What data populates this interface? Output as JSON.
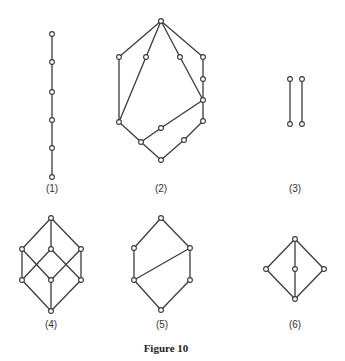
{
  "caption": "Figure 10",
  "colors": {
    "stroke": "#3a3a3a",
    "node_fill": "#ffffff",
    "text": "#333333"
  },
  "diagrams": [
    {
      "label": "(1)",
      "label_pos": [
        52,
        192
      ],
      "nodes": [
        [
          52,
          34
        ],
        [
          52,
          62
        ],
        [
          52,
          92
        ],
        [
          52,
          120
        ],
        [
          52,
          148
        ],
        [
          52,
          177
        ]
      ],
      "edges": [
        [
          0,
          1
        ],
        [
          1,
          2
        ],
        [
          2,
          3
        ],
        [
          3,
          4
        ],
        [
          4,
          5
        ]
      ]
    },
    {
      "label": "(2)",
      "label_pos": [
        161,
        192
      ],
      "nodes": [
        [
          161,
          21
        ],
        [
          119,
          57
        ],
        [
          146,
          57
        ],
        [
          180,
          57
        ],
        [
          203,
          57
        ],
        [
          203,
          79
        ],
        [
          203,
          100
        ],
        [
          203,
          121
        ],
        [
          119,
          122
        ],
        [
          161,
          128
        ],
        [
          141,
          142
        ],
        [
          184,
          140
        ],
        [
          161,
          160
        ]
      ],
      "edges": [
        [
          0,
          1
        ],
        [
          0,
          2
        ],
        [
          0,
          3
        ],
        [
          0,
          4
        ],
        [
          1,
          8
        ],
        [
          2,
          8
        ],
        [
          3,
          6
        ],
        [
          4,
          5
        ],
        [
          5,
          6
        ],
        [
          6,
          7
        ],
        [
          6,
          9
        ],
        [
          9,
          10
        ],
        [
          8,
          10
        ],
        [
          10,
          12
        ],
        [
          7,
          11
        ],
        [
          11,
          12
        ]
      ]
    },
    {
      "label": "(3)",
      "label_pos": [
        295,
        192
      ],
      "nodes": [
        [
          290,
          79
        ],
        [
          290,
          124
        ],
        [
          302,
          79
        ],
        [
          302,
          124
        ]
      ],
      "edges": [
        [
          0,
          1
        ],
        [
          2,
          3
        ]
      ]
    },
    {
      "label": "(4)",
      "label_pos": [
        51,
        328
      ],
      "nodes": [
        [
          51,
          218
        ],
        [
          22,
          249
        ],
        [
          51,
          249
        ],
        [
          81,
          249
        ],
        [
          22,
          280
        ],
        [
          51,
          280
        ],
        [
          81,
          280
        ],
        [
          51,
          311
        ]
      ],
      "edges": [
        [
          0,
          1
        ],
        [
          0,
          2
        ],
        [
          0,
          3
        ],
        [
          1,
          4
        ],
        [
          1,
          5
        ],
        [
          2,
          4
        ],
        [
          2,
          6
        ],
        [
          3,
          5
        ],
        [
          3,
          6
        ],
        [
          4,
          7
        ],
        [
          5,
          7
        ],
        [
          6,
          7
        ]
      ]
    },
    {
      "label": "(5)",
      "label_pos": [
        162,
        328
      ],
      "nodes": [
        [
          161,
          218
        ],
        [
          134,
          248
        ],
        [
          190,
          248
        ],
        [
          134,
          280
        ],
        [
          190,
          280
        ],
        [
          161,
          310
        ]
      ],
      "edges": [
        [
          0,
          1
        ],
        [
          0,
          2
        ],
        [
          1,
          3
        ],
        [
          2,
          3
        ],
        [
          2,
          4
        ],
        [
          3,
          5
        ],
        [
          4,
          5
        ]
      ]
    },
    {
      "label": "(6)",
      "label_pos": [
        295,
        328
      ],
      "nodes": [
        [
          295,
          239
        ],
        [
          266,
          269
        ],
        [
          295,
          269
        ],
        [
          324,
          269
        ],
        [
          295,
          299
        ]
      ],
      "edges": [
        [
          0,
          1
        ],
        [
          0,
          2
        ],
        [
          0,
          3
        ],
        [
          1,
          4
        ],
        [
          2,
          4
        ],
        [
          3,
          4
        ]
      ]
    }
  ]
}
